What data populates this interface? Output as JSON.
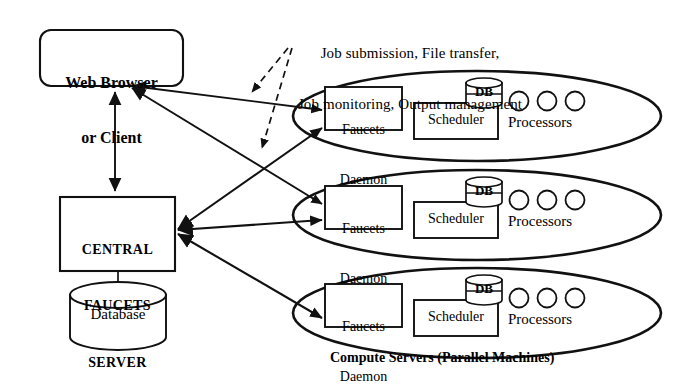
{
  "diagram": {
    "stroke_color": "#111111",
    "background_color": "#ffffff",
    "caption": "Compute Servers (Parallel Machines)"
  },
  "annotation": {
    "line1": "Job submission, File transfer,",
    "line2": "Job monitoring, Output management"
  },
  "client": {
    "line1": "Web Browser",
    "line2": "or Client"
  },
  "central_server": {
    "line1": "CENTRAL",
    "line2": "FAUCETS",
    "line3": "SERVER"
  },
  "database": {
    "label": "Database"
  },
  "compute_servers": [
    {
      "daemon_line1": "Faucets",
      "daemon_line2": "Daemon",
      "scheduler": "Scheduler",
      "db": "DB",
      "processors": "Processors",
      "processor_count": 3
    },
    {
      "daemon_line1": "Faucets",
      "daemon_line2": "Daemon",
      "scheduler": "Scheduler",
      "db": "DB",
      "processors": "Processors",
      "processor_count": 3
    },
    {
      "daemon_line1": "Faucets",
      "daemon_line2": "Daemon",
      "scheduler": "Scheduler",
      "db": "DB",
      "processors": "Processors",
      "processor_count": 3
    }
  ]
}
